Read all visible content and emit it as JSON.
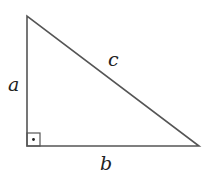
{
  "diagram": {
    "type": "right-triangle",
    "labels": {
      "a": "a",
      "b": "b",
      "c": "c"
    },
    "right_angle_marker": "square-with-dot",
    "stroke_color": "#555555"
  }
}
